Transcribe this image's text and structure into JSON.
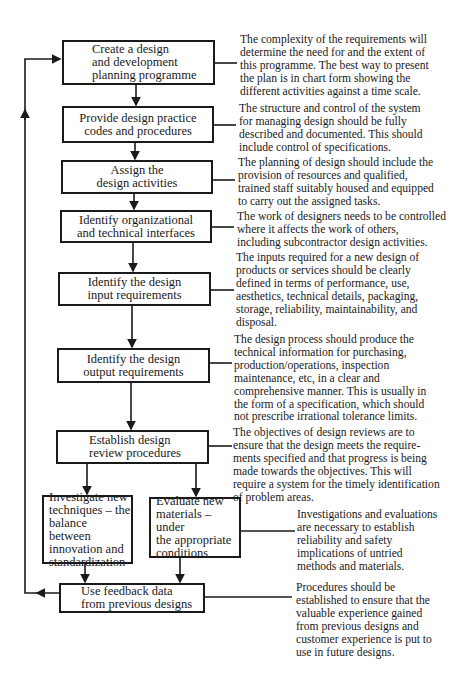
{
  "diagram": {
    "type": "flowchart",
    "steps": [
      {
        "id": "s1",
        "label": "Create a design\nand development\nplanning programme",
        "note": "The complexity of the requirements will\ndetermine the need for and the extent of\nthis programme.  The best way to present\nthe plan is in chart form showing the\ndifferent activities against a time scale."
      },
      {
        "id": "s2",
        "label": "Provide design practice\ncodes and procedures",
        "note": "The structure and control of the system\nfor managing design should be fully\ndescribed and documented.  This should\ninclude control of specifications."
      },
      {
        "id": "s3",
        "label": "Assign the\ndesign activities",
        "note": "The planning of design should include the\nprovision of resources and qualified,\ntrained staff suitably housed and equipped\nto carry out the assigned tasks."
      },
      {
        "id": "s4",
        "label": "Identify organizational\nand technical interfaces",
        "note": "The work of designers needs to be controlled\nwhere it affects the work of others,\nincluding subcontractor design activities."
      },
      {
        "id": "s5",
        "label": "Identify the design\ninput requirements",
        "note": "The inputs required for a new design of\nproducts or services should be clearly\ndefined in terms of performance, use,\naesthetics, technical details, packaging,\nstorage, reliability, maintainability, and\ndisposal."
      },
      {
        "id": "s6",
        "label": "Identify the design\noutput requirements",
        "note": "The design process should produce the\ntechnical information for purchasing,\nproduction/operations, inspection\nmaintenance, etc, in a clear and\ncomprehensive manner.  This is usually in\nthe form of a specification, which should\nnot prescribe irrational tolerance limits."
      },
      {
        "id": "s7",
        "label": "Establish design\nreview procedures",
        "note": "The objectives of design reviews are to\nensure that the design meets the require-\nments specified and that progress is being\nmade towards the objectives.  This will\nrequire a system for the timely identification\n      of problem areas."
      },
      {
        "id": "s8",
        "label": "Investigate new\ntechniques –  the\nbalance between\ninnovation and\nstandardization",
        "note": ""
      },
      {
        "id": "s9",
        "label": "Evaluate new\nmaterials – under\nthe appropriate\nconditions",
        "note": "Investigations and evaluations\nare necessary to establish\nreliability and safety\nimplications of untried\nmethods and materials."
      },
      {
        "id": "s10",
        "label": "Use feedback data\nfrom previous designs",
        "note": "Procedures should be\nestablished to ensure that the\nvaluable experience gained\nfrom previous designs and\ncustomer experience is put to\nuse in future designs."
      }
    ],
    "edges": [
      [
        "s1",
        "s2"
      ],
      [
        "s2",
        "s3"
      ],
      [
        "s3",
        "s4"
      ],
      [
        "s4",
        "s5"
      ],
      [
        "s5",
        "s6"
      ],
      [
        "s6",
        "s7"
      ],
      [
        "s7",
        "s8"
      ],
      [
        "s7",
        "s9"
      ],
      [
        "s8",
        "s10"
      ],
      [
        "s9",
        "s10"
      ],
      [
        "s10",
        "s1"
      ]
    ],
    "colors": {
      "ink": "#1a1a1a",
      "background": "#ffffff"
    }
  }
}
